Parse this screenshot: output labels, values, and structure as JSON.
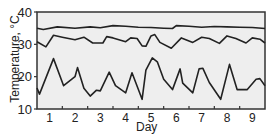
{
  "chart_data": {
    "type": "line",
    "title": "",
    "xlabel": "Day",
    "ylabel": "Temperature, °C",
    "xlim": [
      0.5,
      9.5
    ],
    "ylim": [
      10,
      40
    ],
    "xticks": [
      1,
      2,
      3,
      4,
      5,
      6,
      7,
      8,
      9
    ],
    "yticks": [
      10,
      20,
      30,
      40
    ],
    "grid": false,
    "legend": null,
    "background": "#eeeeee",
    "line_color": "#222222",
    "series": [
      {
        "name": "upper",
        "x": [
          0.5,
          0.75,
          1.3,
          2.0,
          2.6,
          3.0,
          3.5,
          4.0,
          4.5,
          5.0,
          5.5,
          5.85,
          6.0,
          6.5,
          7.0,
          7.5,
          8.0,
          8.5,
          9.0,
          9.5
        ],
        "y": [
          35,
          34.6,
          35.4,
          35.0,
          35.4,
          35.1,
          35.8,
          35.6,
          35.3,
          35.2,
          35.0,
          34.9,
          35.8,
          35.6,
          35.3,
          35.5,
          35.4,
          35.3,
          35.2,
          34.9
        ]
      },
      {
        "name": "middle",
        "x": [
          0.5,
          0.85,
          1.15,
          1.5,
          2.0,
          2.35,
          2.7,
          3.1,
          3.25,
          3.5,
          4.0,
          4.2,
          4.45,
          4.65,
          4.8,
          5.0,
          5.15,
          5.35,
          5.8,
          6.2,
          6.65,
          7.0,
          7.3,
          7.7,
          8.0,
          8.35,
          8.75,
          9.0,
          9.3,
          9.5
        ],
        "y": [
          30.8,
          29.2,
          32.8,
          32.2,
          31.4,
          32.2,
          30.4,
          30.4,
          32.4,
          32.0,
          30.8,
          32.0,
          31.8,
          29.5,
          29.4,
          32.6,
          33.0,
          30.6,
          28.8,
          32.0,
          30.6,
          32.2,
          31.8,
          30.3,
          32.6,
          31.8,
          30.4,
          32.0,
          31.6,
          30.4
        ]
      },
      {
        "name": "lower",
        "x": [
          0.5,
          0.6,
          1.15,
          1.55,
          2.0,
          2.1,
          2.35,
          2.6,
          2.85,
          3.0,
          3.35,
          3.6,
          4.0,
          4.25,
          4.65,
          4.8,
          5.05,
          5.25,
          5.5,
          5.85,
          6.15,
          6.25,
          6.65,
          6.9,
          7.05,
          7.3,
          7.75,
          8.1,
          8.4,
          8.8,
          9.15,
          9.3,
          9.5
        ],
        "y": [
          16.5,
          14.6,
          25.6,
          17.2,
          20.0,
          22.8,
          16.4,
          14.0,
          15.8,
          15.6,
          21.4,
          17.2,
          15.0,
          21.2,
          13.0,
          22.0,
          25.8,
          24.6,
          19.2,
          16.0,
          22.4,
          18.0,
          15.0,
          22.4,
          22.6,
          18.2,
          13.0,
          23.8,
          16.0,
          16.0,
          19.2,
          19.4,
          17.2
        ]
      }
    ]
  },
  "axes": {
    "xlabel": "Day",
    "ylabel": "Temperature, °C",
    "ytick_labels": [
      "40",
      "30",
      "20",
      "10"
    ],
    "xtick_labels": [
      "1",
      "2",
      "3",
      "4",
      "5",
      "6",
      "7",
      "8",
      "9"
    ]
  }
}
